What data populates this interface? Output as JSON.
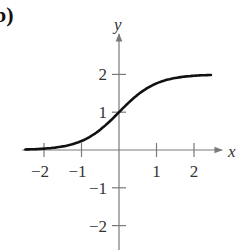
{
  "panel_label": "b)",
  "chart_data": {
    "type": "line",
    "title": "",
    "xlabel": "x",
    "ylabel": "y",
    "xlim": [
      -2.5,
      2.6
    ],
    "ylim": [
      -2.5,
      2.8
    ],
    "x_ticks": [
      -2,
      -1,
      1,
      2
    ],
    "x_tick_labels": [
      "−2",
      "−1",
      "1",
      "2"
    ],
    "y_ticks": [
      -2,
      -1,
      1,
      2
    ],
    "y_tick_labels": [
      "−2",
      "−1",
      "1",
      "2"
    ],
    "grid": false,
    "legend": null,
    "series": [
      {
        "name": "f(x) = 2/(1+e^(-2x))",
        "x": [
          -2.5,
          -2,
          -1.5,
          -1,
          -0.5,
          0,
          0.5,
          1,
          1.5,
          2,
          2.5
        ],
        "y": [
          0.01,
          0.04,
          0.09,
          0.24,
          0.54,
          1.0,
          1.46,
          1.76,
          1.91,
          1.96,
          1.99
        ]
      }
    ],
    "axis_color": "#7a7a7a",
    "curve_color": "#111111"
  }
}
